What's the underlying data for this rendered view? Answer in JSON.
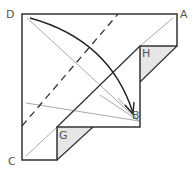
{
  "diagram": {
    "type": "origami-fold-step",
    "labels": {
      "A": "A",
      "B": "B",
      "C": "C",
      "D": "D",
      "G": "G",
      "H": "H"
    },
    "colors": {
      "outline": "#333333",
      "crease": "#aaaaaa",
      "shade": "#e6e6e6",
      "label": "#555555",
      "arrow": "#222222"
    },
    "annotations": {
      "fold_arrow": "fold corner D down to point B",
      "dashed_line": "valley fold line"
    }
  }
}
